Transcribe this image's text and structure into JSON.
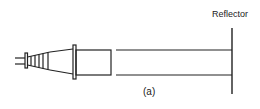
{
  "diagram": {
    "labels": {
      "reflector": "Reflector",
      "figure_caption": "(a)"
    },
    "components": [
      {
        "id": "coax-feed-wires",
        "description": "Input feed wires"
      },
      {
        "id": "feed-flange-small",
        "description": "Small connector flange"
      },
      {
        "id": "stepped-transition",
        "description": "Stepped taper transition"
      },
      {
        "id": "horn-taper",
        "description": "Conical taper"
      },
      {
        "id": "feed-flange-large",
        "description": "Large flange"
      },
      {
        "id": "waveguide-section",
        "description": "Rectangular waveguide section"
      },
      {
        "id": "transmission-lines",
        "description": "Parallel propagation lines"
      },
      {
        "id": "reflector",
        "description": "Reflector plate"
      }
    ],
    "colors": {
      "stroke": "#222222",
      "background": "#ffffff"
    }
  }
}
